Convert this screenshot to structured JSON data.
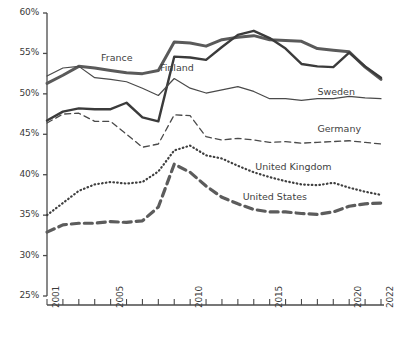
{
  "chart_data": {
    "type": "line",
    "title": "",
    "xlabel": "",
    "ylabel": "",
    "xlim": [
      2001,
      2022
    ],
    "ylim": [
      25,
      60
    ],
    "ytick_values": [
      25,
      30,
      35,
      40,
      45,
      50,
      55,
      60
    ],
    "ytick_labels": [
      "25%",
      "30%",
      "35%",
      "40%",
      "45%",
      "50%",
      "55%",
      "60%"
    ],
    "x": [
      2001,
      2002,
      2003,
      2004,
      2005,
      2006,
      2007,
      2008,
      2009,
      2010,
      2011,
      2012,
      2013,
      2014,
      2015,
      2016,
      2017,
      2018,
      2019,
      2020,
      2021,
      2022
    ],
    "xtick_values": [
      2001,
      2002,
      2003,
      2004,
      2005,
      2006,
      2007,
      2008,
      2009,
      2010,
      2011,
      2012,
      2013,
      2014,
      2015,
      2016,
      2017,
      2018,
      2019,
      2020,
      2021,
      2022
    ],
    "xtick_labeled": [
      2001,
      2005,
      2010,
      2015,
      2020,
      2022
    ],
    "grid": false,
    "legend_position": "inline-annotations",
    "series": [
      {
        "name": "France",
        "style": "solid-thick",
        "color": "#5a5a5a",
        "label_x": 2004.4,
        "label_y": 54.4,
        "values": [
          51.3,
          52.3,
          53.4,
          53.2,
          52.9,
          52.6,
          52.5,
          52.9,
          56.4,
          56.3,
          55.9,
          56.7,
          57.0,
          57.2,
          56.7,
          56.6,
          56.5,
          55.6,
          55.4,
          55.2,
          53.3,
          51.8
        ]
      },
      {
        "name": "Finland",
        "style": "solid-thick-dark",
        "color": "#3b3b3b",
        "label_x": 2008.1,
        "label_y": 53.2,
        "values": [
          46.7,
          47.8,
          48.2,
          48.1,
          48.1,
          48.9,
          47.1,
          46.6,
          54.6,
          54.5,
          54.2,
          55.8,
          57.3,
          57.8,
          56.9,
          55.6,
          53.7,
          53.4,
          53.3,
          55.1,
          53.4,
          52.0
        ]
      },
      {
        "name": "Sweden",
        "style": "solid-thin",
        "color": "#4a4a4a",
        "label_x": 2018.0,
        "label_y": 50.2,
        "values": [
          52.2,
          53.2,
          53.4,
          52.0,
          51.8,
          51.5,
          50.7,
          49.8,
          51.9,
          50.7,
          50.1,
          50.5,
          50.9,
          50.3,
          49.4,
          49.4,
          49.2,
          49.4,
          49.4,
          49.7,
          49.5,
          49.4
        ]
      },
      {
        "name": "Germany",
        "style": "dashed-thin",
        "color": "#4a4a4a",
        "label_x": 2018.0,
        "label_y": 45.7,
        "values": [
          46.4,
          47.5,
          47.6,
          46.6,
          46.6,
          45.0,
          43.4,
          43.8,
          47.4,
          47.3,
          44.7,
          44.3,
          44.5,
          44.3,
          44.0,
          44.1,
          43.9,
          44.0,
          44.1,
          44.2,
          44.0,
          43.8
        ]
      },
      {
        "name": "United Kingdom",
        "style": "dotted",
        "color": "#3f3f3f",
        "label_x": 2014.1,
        "label_y": 41.0,
        "values": [
          35.0,
          36.5,
          38.0,
          38.8,
          39.1,
          38.9,
          39.1,
          40.4,
          43.0,
          43.6,
          42.4,
          42.0,
          41.1,
          40.3,
          39.7,
          39.2,
          38.8,
          38.7,
          39.0,
          38.4,
          37.9,
          37.5
        ]
      },
      {
        "name": "United States",
        "style": "dashed-thick",
        "color": "#5c5c5c",
        "label_x": 2013.3,
        "label_y": 37.2,
        "values": [
          32.9,
          33.8,
          34.0,
          34.0,
          34.2,
          34.1,
          34.3,
          36.0,
          41.3,
          40.3,
          38.6,
          37.2,
          36.4,
          35.7,
          35.4,
          35.4,
          35.2,
          35.1,
          35.4,
          36.1,
          36.4,
          36.5
        ]
      }
    ]
  }
}
